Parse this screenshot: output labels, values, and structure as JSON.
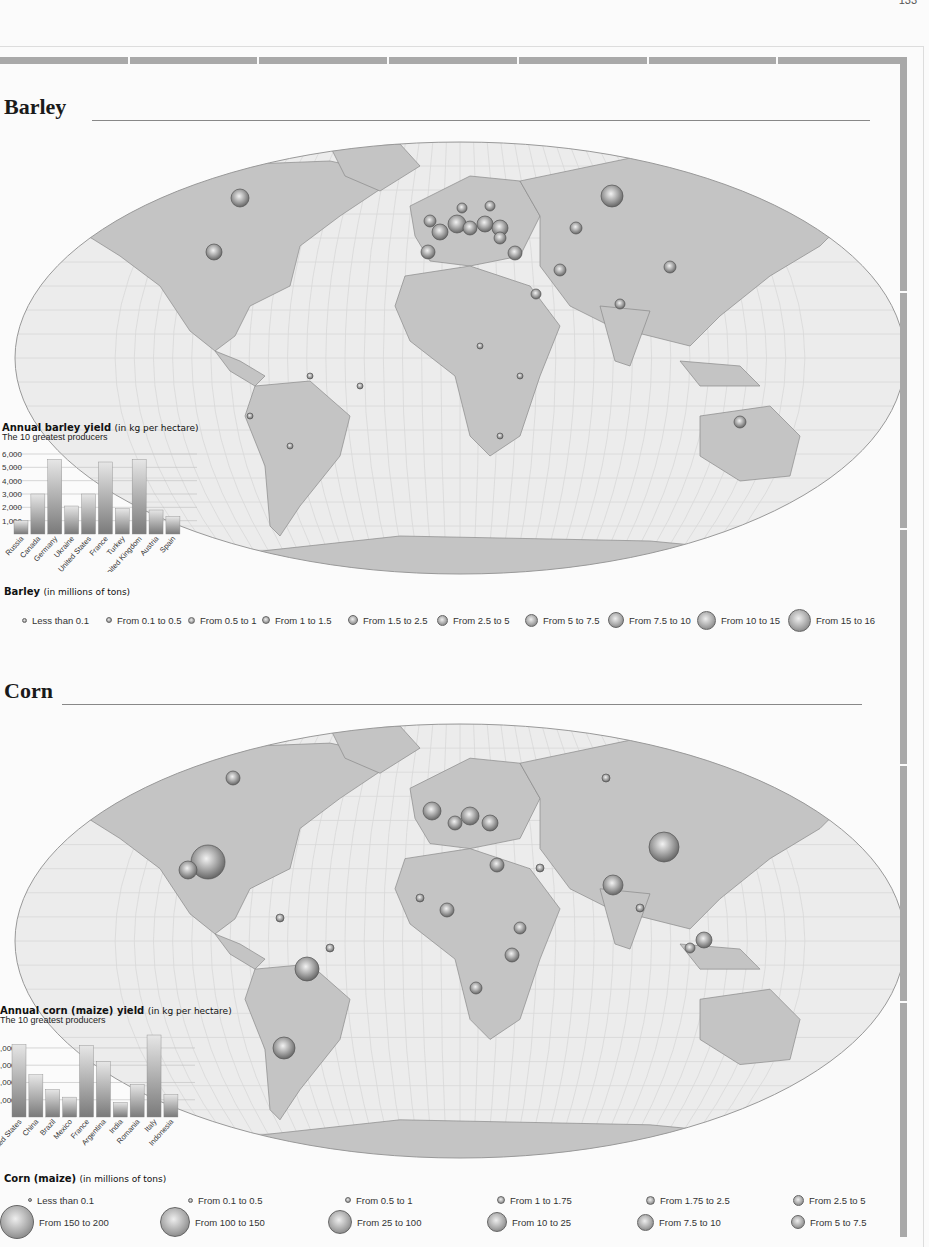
{
  "page": {
    "page_number": "133",
    "sections": [
      {
        "title": "Barley",
        "map_caption": "World map of barley production by country",
        "chart": {
          "title": "Annual barley yield",
          "unit": "(in kg per hectare)",
          "subtitle": "The 10 greatest producers",
          "y_ticks": [
            "6,000",
            "5,000",
            "4,000",
            "3,000",
            "2,000",
            "1,000"
          ]
        },
        "legend": {
          "title": "Barley",
          "unit": "(in millions of tons)",
          "items": [
            {
              "label": "Less than 0.1",
              "size": 5
            },
            {
              "label": "From 0.1 to 0.5",
              "size": 6
            },
            {
              "label": "From 0.5 to 1",
              "size": 7
            },
            {
              "label": "From 1 to 1.5",
              "size": 8
            },
            {
              "label": "From 1.5 to 2.5",
              "size": 10
            },
            {
              "label": "From 2.5 to 5",
              "size": 11
            },
            {
              "label": "From 5 to 7.5",
              "size": 13
            },
            {
              "label": "From 7.5 to 10",
              "size": 16
            },
            {
              "label": "From 10 to 15",
              "size": 19
            },
            {
              "label": "From 15 to 16",
              "size": 23
            }
          ]
        }
      },
      {
        "title": "Corn",
        "map_caption": "World map of corn (maize) production by country",
        "chart": {
          "title": "Annual corn (maize) yield",
          "unit": "(in kg per hectare)",
          "subtitle": "The 10 greatest producers",
          "y_ticks": [
            ",000",
            ",000",
            ",000",
            ",000"
          ]
        },
        "legend": {
          "title": "Corn (maize)",
          "unit": "(in millions of tons)",
          "items": [
            {
              "label": "Less than 0.1",
              "size": 4
            },
            {
              "label": "From 0.1 to 0.5",
              "size": 5
            },
            {
              "label": "From 0.5 to 1",
              "size": 6
            },
            {
              "label": "From 1 to 1.75",
              "size": 8
            },
            {
              "label": "From 1.75 to 2.5",
              "size": 9
            },
            {
              "label": "From 2.5 to 5",
              "size": 11
            },
            {
              "label": "From 150 to 200",
              "size": 34
            },
            {
              "label": "From 100 to 150",
              "size": 30
            },
            {
              "label": "From 25 to 100",
              "size": 24
            },
            {
              "label": "From 10 to 25",
              "size": 20
            },
            {
              "label": "From 7.5 to 10",
              "size": 17
            },
            {
              "label": "From 5 to 7.5",
              "size": 14
            }
          ]
        }
      }
    ]
  },
  "chart_data": [
    {
      "type": "bar",
      "title": "Annual barley yield (in kg per hectare)",
      "subtitle": "The 10 greatest producers",
      "categories": [
        "Russia",
        "Canada",
        "Germany",
        "Ukraine",
        "United States",
        "France",
        "Turkey",
        "United Kingdom",
        "Austria",
        "Spain"
      ],
      "values": [
        1000,
        3000,
        5600,
        2100,
        3000,
        5400,
        1900,
        5600,
        1800,
        1300
      ],
      "xlabel": "",
      "ylabel": "kg per hectare",
      "ylim": [
        0,
        6000
      ],
      "y_ticks": [
        1000,
        2000,
        3000,
        4000,
        5000,
        6000
      ],
      "grid": true
    },
    {
      "type": "bar",
      "title": "Annual corn (maize) yield (in kg per hectare)",
      "subtitle": "The 10 greatest producers",
      "categories": [
        "United States",
        "China",
        "Brazil",
        "Mexico",
        "France",
        "Argentina",
        "India",
        "Romania",
        "Italy",
        "Indonesia"
      ],
      "values": [
        8400,
        4900,
        3200,
        2300,
        8300,
        6400,
        1700,
        3800,
        9500,
        2600
      ],
      "xlabel": "",
      "ylabel": "kg per hectare",
      "ylim": [
        0,
        10000
      ],
      "y_ticks": [
        2000,
        4000,
        6000,
        8000
      ],
      "grid": true
    }
  ],
  "colors": {
    "land": "#c4c4c4",
    "ocean": "#ececec",
    "grid": "#d8d8d8",
    "frame": "#a9a9a9",
    "bar_top": "#e6e6e6",
    "bar_bottom": "#7a7a7a"
  }
}
